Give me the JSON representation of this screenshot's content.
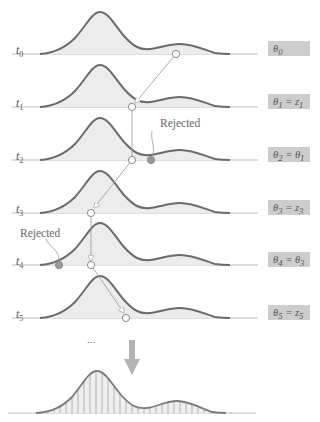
{
  "diagram": {
    "rows": [
      {
        "time_label": "t",
        "time_sub": "0",
        "state_label": "θ₀",
        "state_html_main": "θ",
        "state_sub": "0",
        "rhs": "",
        "rhs_sub": ""
      },
      {
        "time_label": "t",
        "time_sub": "1",
        "state_html_main": "θ",
        "state_sub": "1",
        "rhs": "= z",
        "rhs_sub": "1"
      },
      {
        "time_label": "t",
        "time_sub": "2",
        "state_html_main": "θ",
        "state_sub": "2",
        "rhs": "= θ",
        "rhs_sub": "1"
      },
      {
        "time_label": "t",
        "time_sub": "3",
        "state_html_main": "θ",
        "state_sub": "3",
        "rhs": "= z",
        "rhs_sub": "3"
      },
      {
        "time_label": "t",
        "time_sub": "4",
        "state_html_main": "θ",
        "state_sub": "4",
        "rhs": "= θ",
        "rhs_sub": "3"
      },
      {
        "time_label": "t",
        "time_sub": "5",
        "state_html_main": "θ",
        "state_sub": "5",
        "rhs": "= z",
        "rhs_sub": "5"
      }
    ],
    "annotations": {
      "rejected_1": "Rejected",
      "rejected_2": "Rejected",
      "ellipsis": "..."
    },
    "colors": {
      "curve": "#6b6b6b",
      "fill": "#ececec",
      "baseline": "#bdbdbd",
      "label_box": "#cdcdcd",
      "rejected_point": "#9a9a9a",
      "arrow": "#a8a8a8"
    }
  }
}
